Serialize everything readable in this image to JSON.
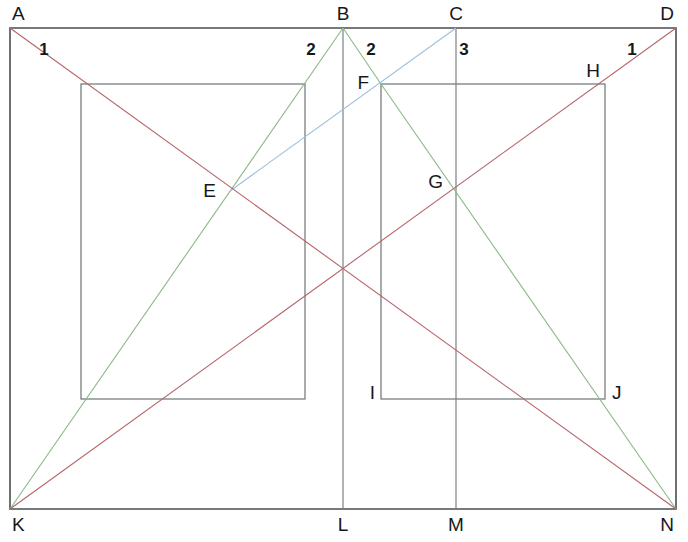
{
  "figure": {
    "width": 688,
    "height": 542
  },
  "colors": {
    "frame_stroke": "#4a4f52",
    "inner_rect_stroke": "#6e7376",
    "vertical_stroke": "#7c8184",
    "red_line": "#b5656a",
    "green_line": "#8cb887",
    "blue_line": "#9cc0dd",
    "label_text": "#16181a",
    "background": "#ffffff"
  },
  "outer_rectangle": {
    "name": "ADNK",
    "corners": [
      {
        "id": "A",
        "x": 10,
        "y": 28
      },
      {
        "id": "D",
        "x": 676,
        "y": 28
      },
      {
        "id": "N",
        "x": 676,
        "y": 509
      },
      {
        "id": "K",
        "x": 10,
        "y": 509
      }
    ]
  },
  "top_points": [
    {
      "id": "B",
      "x": 343,
      "y": 28
    },
    {
      "id": "C",
      "x": 456,
      "y": 28
    }
  ],
  "bottom_points": [
    {
      "id": "L",
      "x": 343,
      "y": 509
    },
    {
      "id": "M",
      "x": 456,
      "y": 509
    }
  ],
  "inner_rectangles": [
    {
      "name": "left-inner-rectangle",
      "x1": 81,
      "y1": 84,
      "x2": 305,
      "y2": 399
    },
    {
      "name": "right-inner-rectangle",
      "x1": 381,
      "y1": 84,
      "x2": 605,
      "y2": 399
    }
  ],
  "vertical_lines": [
    {
      "name": "line-BL",
      "x": 343,
      "y1": 28,
      "y2": 509
    },
    {
      "name": "line-CM",
      "x": 456,
      "y1": 28,
      "y2": 509
    }
  ],
  "red_lines": [
    {
      "name": "diagonal-A-to-N",
      "x1": 10,
      "y1": 28,
      "x2": 676,
      "y2": 509
    },
    {
      "name": "diagonal-D-to-K",
      "x1": 676,
      "y1": 28,
      "x2": 10,
      "y2": 509
    }
  ],
  "green_lines": [
    {
      "name": "line-K-to-B",
      "x1": 10,
      "y1": 509,
      "x2": 343,
      "y2": 28
    },
    {
      "name": "line-B-to-I-extended",
      "x1": 343,
      "y1": 28,
      "x2": 381,
      "y2": 84
    },
    {
      "name": "line-F-to-N",
      "x1": 381,
      "y1": 84,
      "x2": 676,
      "y2": 509
    }
  ],
  "blue_lines": [
    {
      "name": "line-E-to-C",
      "x1": 230,
      "y1": 191,
      "x2": 456,
      "y2": 28
    }
  ],
  "labeled_points": [
    {
      "id": "A",
      "x": 10,
      "y": 28,
      "label_x": 12,
      "label_y": 20,
      "anchor": "start"
    },
    {
      "id": "B",
      "x": 343,
      "y": 28,
      "label_x": 343,
      "label_y": 20,
      "anchor": "middle"
    },
    {
      "id": "C",
      "x": 456,
      "y": 28,
      "label_x": 456,
      "label_y": 20,
      "anchor": "middle"
    },
    {
      "id": "D",
      "x": 676,
      "y": 28,
      "label_x": 674,
      "label_y": 20,
      "anchor": "end"
    },
    {
      "id": "E",
      "x": 230,
      "y": 191,
      "label_x": 216,
      "label_y": 197,
      "anchor": "end"
    },
    {
      "id": "F",
      "x": 381,
      "y": 84,
      "label_x": 369,
      "label_y": 89,
      "anchor": "end"
    },
    {
      "id": "G",
      "x": 456,
      "y": 191,
      "label_x": 443,
      "label_y": 188,
      "anchor": "end"
    },
    {
      "id": "H",
      "x": 605,
      "y": 84,
      "label_x": 600,
      "label_y": 77,
      "anchor": "end"
    },
    {
      "id": "I",
      "x": 381,
      "y": 399,
      "label_x": 375,
      "label_y": 399,
      "anchor": "end"
    },
    {
      "id": "J",
      "x": 605,
      "y": 399,
      "label_x": 612,
      "label_y": 399,
      "anchor": "start"
    },
    {
      "id": "K",
      "x": 10,
      "y": 509,
      "label_x": 12,
      "label_y": 531,
      "anchor": "start"
    },
    {
      "id": "L",
      "x": 343,
      "y": 509,
      "label_x": 343,
      "label_y": 531,
      "anchor": "middle"
    },
    {
      "id": "M",
      "x": 456,
      "y": 509,
      "label_x": 456,
      "label_y": 531,
      "anchor": "middle"
    },
    {
      "id": "N",
      "x": 676,
      "y": 509,
      "label_x": 674,
      "label_y": 531,
      "anchor": "end"
    }
  ],
  "angle_labels": [
    {
      "id": "angle-1-left",
      "text": "1",
      "x": 44,
      "y": 55
    },
    {
      "id": "angle-2-left",
      "text": "2",
      "x": 311,
      "y": 55
    },
    {
      "id": "angle-2-right",
      "text": "2",
      "x": 371,
      "y": 55
    },
    {
      "id": "angle-3",
      "text": "3",
      "x": 464,
      "y": 55
    },
    {
      "id": "angle-1-right",
      "text": "1",
      "x": 632,
      "y": 55
    }
  ]
}
